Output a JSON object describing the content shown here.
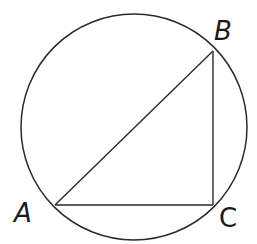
{
  "diagram": {
    "type": "inscribed-right-triangle",
    "stroke_color": "#2a2a2a",
    "background": "#ffffff",
    "circle": {
      "cx": 134,
      "cy": 127,
      "r": 113
    },
    "points": {
      "A": {
        "label": "A",
        "x": 55,
        "y": 205,
        "label_x": 14,
        "label_y": 222
      },
      "B": {
        "label": "B",
        "x": 213,
        "y": 51,
        "label_x": 214,
        "label_y": 40
      },
      "C": {
        "label": "C",
        "x": 213,
        "y": 205,
        "label_x": 219,
        "label_y": 227
      }
    },
    "segments": [
      {
        "name": "AB",
        "from": "A",
        "to": "B"
      },
      {
        "name": "BC",
        "from": "B",
        "to": "C"
      },
      {
        "name": "AC",
        "from": "A",
        "to": "C"
      }
    ]
  }
}
